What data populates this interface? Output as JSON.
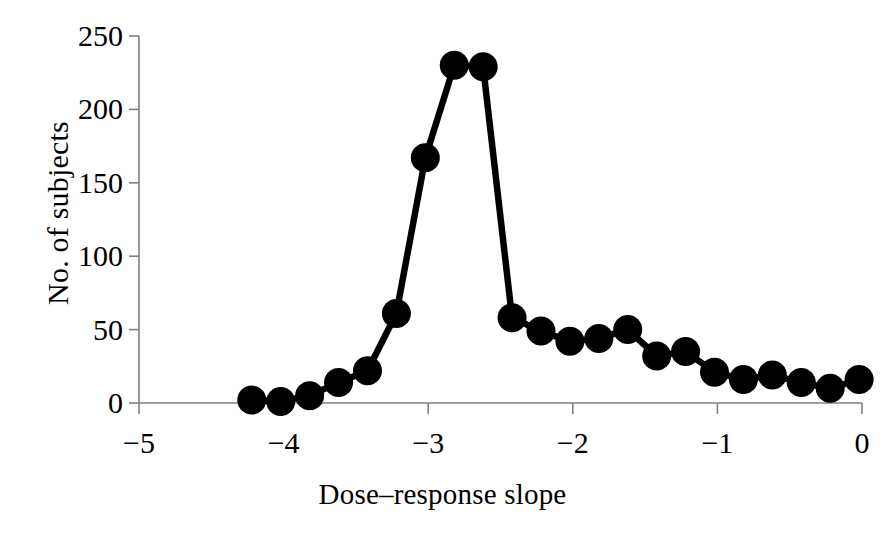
{
  "chart_data": {
    "type": "line",
    "title": "",
    "subtitle": "",
    "xlabel": "Dose–response slope",
    "ylabel": "No. of subjects",
    "xlim": [
      -5,
      0
    ],
    "ylim": [
      0,
      250
    ],
    "xticks": [
      -5,
      -4,
      -3,
      -2,
      -1,
      0
    ],
    "xtick_labels": [
      "−5",
      "−4",
      "−3",
      "−2",
      "−1",
      "0"
    ],
    "yticks": [
      0,
      50,
      100,
      150,
      200,
      250
    ],
    "ytick_labels": [
      "0",
      "50",
      "100",
      "150",
      "200",
      "250"
    ],
    "grid": false,
    "legend": null,
    "marker": "filled-circle",
    "marker_color": "#000000",
    "line_color": "#000000",
    "axis_color": "#808080",
    "x": [
      -4.22,
      -4.02,
      -3.82,
      -3.62,
      -3.42,
      -3.22,
      -3.02,
      -2.82,
      -2.62,
      -2.42,
      -2.22,
      -2.02,
      -1.82,
      -1.62,
      -1.42,
      -1.22,
      -1.02,
      -0.82,
      -0.62,
      -0.42,
      -0.22,
      -0.02
    ],
    "values": [
      2,
      1,
      5,
      14,
      22,
      61,
      167,
      230,
      229,
      58,
      49,
      42,
      44,
      50,
      32,
      35,
      21,
      16,
      19,
      14,
      10,
      16
    ]
  },
  "axes": {
    "x_axis_name": "x-axis",
    "y_axis_name": "y-axis"
  }
}
